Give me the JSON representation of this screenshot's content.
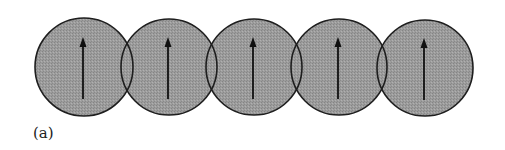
{
  "figure": {
    "label": "(a)",
    "circle_fill": "#9a9a9a",
    "circle_stroke": "#1e1e1e",
    "arrow_color": "#111111",
    "circles": [
      {
        "cx": 84,
        "cy": 67,
        "r": 49,
        "arrow": "up"
      },
      {
        "cx": 169,
        "cy": 67,
        "r": 48,
        "arrow": "up"
      },
      {
        "cx": 254,
        "cy": 67,
        "r": 48,
        "arrow": "up"
      },
      {
        "cx": 339,
        "cy": 67,
        "r": 48,
        "arrow": "up"
      },
      {
        "cx": 425,
        "cy": 68,
        "r": 48,
        "arrow": "up"
      }
    ]
  }
}
